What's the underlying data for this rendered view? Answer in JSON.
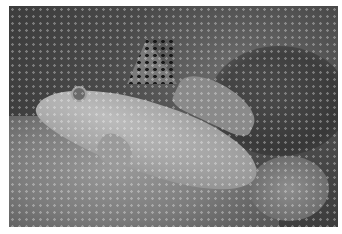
{
  "image": {
    "description": "Grayscale underwater photograph of a spotted goby resting on sandy seabed, tall spotted first dorsal fin raised",
    "subject": "goby fish",
    "setting": "sandy seabed with rocky background",
    "color_mode": "grayscale",
    "colors": {
      "background": "#ffffff",
      "photo_dark": "#333333",
      "sand": "#8c8c8c",
      "fish": "#b0b0b0"
    }
  }
}
